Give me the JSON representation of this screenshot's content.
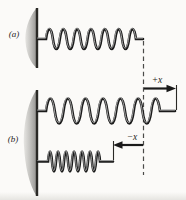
{
  "figure": {
    "type": "physics-spring-diagram",
    "panels": [
      {
        "label": "(a)",
        "spring_state": "relaxed"
      },
      {
        "label": "(b)",
        "spring_state": "stretched and compressed"
      }
    ],
    "annotations": {
      "plus_x_label": "+x",
      "minus_x_label": "−x",
      "equilibrium_marker": "vertical dashed line"
    },
    "springs": [
      {
        "name": "relaxed-spring",
        "panel": "(a)",
        "coils": 7,
        "end_x_position": "at dashed equilibrium line"
      },
      {
        "name": "stretched-spring",
        "panel": "(b)",
        "coils": 7,
        "displacement": "+x beyond dashed line"
      },
      {
        "name": "compressed-spring",
        "panel": "(b)",
        "coils": 7,
        "displacement": "−x short of dashed line"
      }
    ],
    "colors": {
      "background": "#fbfaf8",
      "ink": "#1a1a1a",
      "spring_highlight": "#c8c8c8",
      "wall_light": "#dcdbd8",
      "wall_dark": "#8f8e8b",
      "wall_edge": "#2a2926",
      "dashed_line": "#4a4a48"
    }
  }
}
